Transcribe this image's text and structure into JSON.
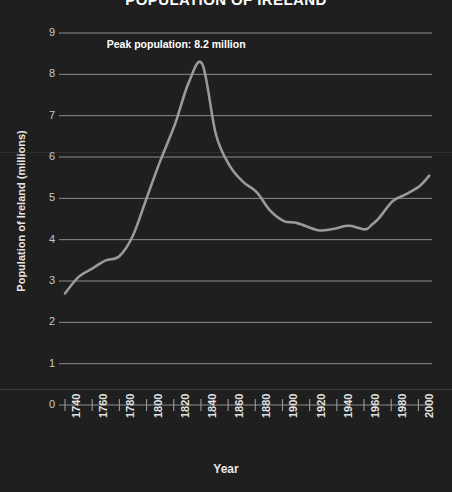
{
  "chart_data": {
    "type": "line",
    "title": "POPULATION OF IRELAND",
    "xlabel": "Year",
    "ylabel": "Population of Ireland (millions)",
    "xlim": [
      1740,
      2010
    ],
    "ylim": [
      0,
      9
    ],
    "grid": true,
    "legend": "none",
    "xticks": [
      1740,
      1760,
      1780,
      1800,
      1820,
      1840,
      1860,
      1880,
      1900,
      1920,
      1940,
      1960,
      1980,
      2000
    ],
    "yticks": [
      0,
      1,
      2,
      3,
      4,
      5,
      6,
      7,
      8,
      9
    ],
    "line_color": "#9a9a9a",
    "background_color": "#1f1f1f",
    "grid_color": "#8d8d8d",
    "annotations": [
      {
        "text": "Peak population: 8.2 million",
        "x": 1820,
        "y": 8.7
      }
    ],
    "series": [
      {
        "name": "Population of Ireland",
        "x": [
          1740,
          1750,
          1760,
          1770,
          1780,
          1790,
          1800,
          1810,
          1821,
          1831,
          1841,
          1851,
          1861,
          1871,
          1881,
          1891,
          1901,
          1911,
          1926,
          1936,
          1946,
          1951,
          1961,
          1966,
          1971,
          1981,
          1991,
          2001,
          2008
        ],
        "values": [
          2.7,
          3.1,
          3.3,
          3.5,
          3.6,
          4.1,
          5.0,
          5.9,
          6.8,
          7.8,
          8.25,
          6.55,
          5.8,
          5.4,
          5.15,
          4.7,
          4.45,
          4.4,
          4.23,
          4.25,
          4.33,
          4.33,
          4.25,
          4.37,
          4.52,
          4.93,
          5.1,
          5.3,
          5.55
        ]
      }
    ]
  },
  "axis": {
    "y_tick_labels": [
      "9",
      "8",
      "7",
      "6",
      "5",
      "4",
      "3",
      "2",
      "1",
      "0"
    ],
    "x_tick_labels": [
      "1740",
      "1760",
      "1780",
      "1800",
      "1820",
      "1840",
      "1860",
      "1880",
      "1900",
      "1920",
      "1940",
      "1960",
      "1980",
      "2000"
    ]
  }
}
